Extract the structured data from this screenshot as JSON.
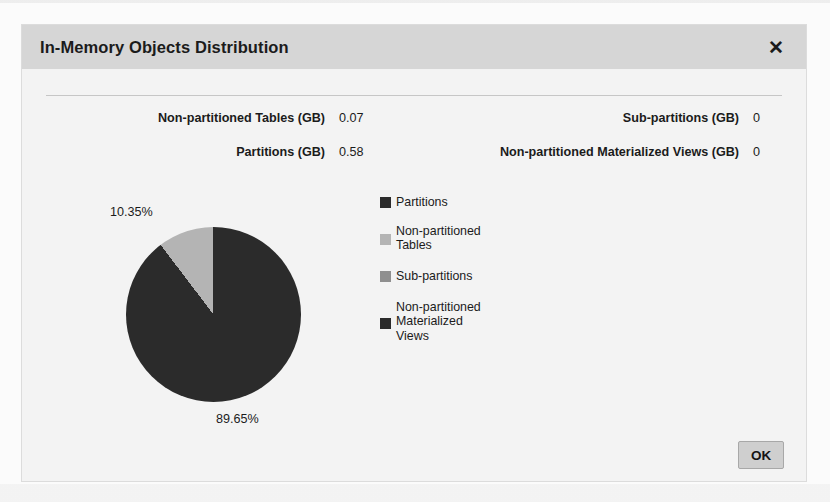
{
  "dialog": {
    "title": "In-Memory Objects Distribution",
    "close_icon": "close-icon",
    "close_label": "✕"
  },
  "summary": {
    "left": [
      {
        "label": "Non-partitioned Tables (GB)",
        "value": "0.07"
      },
      {
        "label": "Partitions (GB)",
        "value": "0.58"
      }
    ],
    "right": [
      {
        "label": "Sub-partitions (GB)",
        "value": "0"
      },
      {
        "label": "Non-partitioned Materialized Views (GB)",
        "value": "0"
      }
    ]
  },
  "chart_data": {
    "type": "pie",
    "title": "In-Memory Objects Distribution",
    "categories": [
      "Partitions",
      "Non-partitioned Tables",
      "Sub-partitions",
      "Non-partitioned Materialized Views"
    ],
    "values": [
      0.58,
      0.07,
      0,
      0
    ],
    "unit": "GB",
    "percents": [
      89.65,
      10.35,
      0,
      0
    ],
    "data_labels": [
      "89.65%",
      "10.35%"
    ],
    "colors": [
      "#2b2b2b",
      "#b4b4b4",
      "#8f8f8f",
      "#2b2b2b"
    ],
    "legend_position": "right",
    "grid": false,
    "start_angle_deg": 0,
    "direction": "clockwise"
  },
  "legend": [
    {
      "label": "Partitions",
      "color": "#2b2b2b"
    },
    {
      "label": "Non-partitioned\nTables",
      "color": "#b4b4b4"
    },
    {
      "label": "Sub-partitions",
      "color": "#8f8f8f"
    },
    {
      "label": "Non-partitioned\nMaterialized\nViews",
      "color": "#2b2b2b"
    }
  ],
  "footer": {
    "ok_label": "OK"
  }
}
